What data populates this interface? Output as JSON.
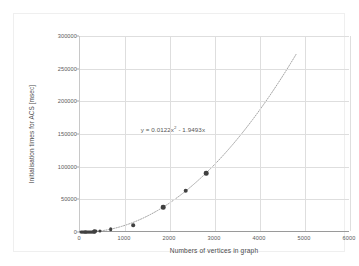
{
  "chart_data": {
    "type": "scatter",
    "title": "",
    "xlabel": "Numbers of vertices in graph",
    "ylabel": "Initialisation times for ACS  [msec]",
    "xlim": [
      0,
      6000
    ],
    "ylim": [
      0,
      300000
    ],
    "xticks": [
      0,
      1000,
      2000,
      3000,
      4000,
      5000,
      6000
    ],
    "xtick_labels": [
      "0",
      "1000",
      "2000",
      "3000",
      "4000",
      "5000",
      "6000"
    ],
    "yticks": [
      0,
      50000,
      100000,
      150000,
      200000,
      250000,
      300000
    ],
    "ytick_labels": [
      "0",
      "50000",
      "100000",
      "150000",
      "200000",
      "250000",
      "300000"
    ],
    "grid": true,
    "legend": "none",
    "marker_color": "#404040",
    "trendline_color": "#888888",
    "trendline_style": "dotted",
    "annotation": "y = 0.0122x² - 1.9493x",
    "annotation_coeff_quadratic": 0.0122,
    "annotation_coeff_linear": -1.9493,
    "trendline_x_range": [
      0,
      4800
    ],
    "points": [
      {
        "x": 20,
        "y": 0
      },
      {
        "x": 40,
        "y": 0
      },
      {
        "x": 60,
        "y": 0
      },
      {
        "x": 80,
        "y": 0
      },
      {
        "x": 100,
        "y": 100
      },
      {
        "x": 120,
        "y": 150
      },
      {
        "x": 140,
        "y": 200
      },
      {
        "x": 160,
        "y": 250
      },
      {
        "x": 180,
        "y": 300
      },
      {
        "x": 200,
        "y": 400
      },
      {
        "x": 220,
        "y": 450
      },
      {
        "x": 240,
        "y": 500
      },
      {
        "x": 260,
        "y": 600
      },
      {
        "x": 280,
        "y": 700
      },
      {
        "x": 300,
        "y": 800
      },
      {
        "x": 320,
        "y": 900
      },
      {
        "x": 340,
        "y": 1000
      },
      {
        "x": 360,
        "y": 1100
      },
      {
        "x": 450,
        "y": 1500
      },
      {
        "x": 680,
        "y": 4000
      },
      {
        "x": 1180,
        "y": 10000
      },
      {
        "x": 1850,
        "y": 38000
      },
      {
        "x": 2350,
        "y": 63000
      },
      {
        "x": 2800,
        "y": 90000
      }
    ]
  },
  "annotation_parts": {
    "prefix": "y = 0.0122x",
    "exponent": "2",
    "suffix": " - 1.9493x"
  }
}
